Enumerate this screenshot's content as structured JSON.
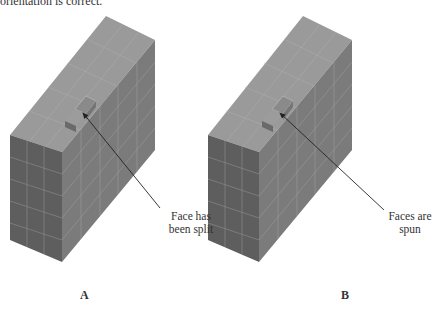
{
  "header": {
    "text": "orientation is correct."
  },
  "figures": [
    {
      "id": "A",
      "label": "A",
      "callout": {
        "line1": "Face has",
        "line2": "been split"
      }
    },
    {
      "id": "B",
      "label": "B",
      "callout": {
        "line1": "Faces are",
        "line2": "spun"
      }
    }
  ],
  "colors": {
    "top_face": "#9a9a9a",
    "front_face": "#5e5e5e",
    "side_face": "#7b7b7b",
    "grid_line": "#b8b8b8",
    "notch_face": "#6f6f6f",
    "arrow": "#222222"
  }
}
